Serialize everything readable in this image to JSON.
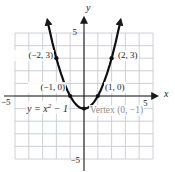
{
  "figure": {
    "bg": "#ffffff",
    "grid_color": "#c6cbd1",
    "axis_color": "#1a1a1a",
    "curve_color": "#101010",
    "point_color": "#101010",
    "text_color": "#1b1b1b",
    "vertex_label_color": "#8e8e8e"
  },
  "chart_data": {
    "type": "line",
    "title": "",
    "equation": "y = x^2 − 1",
    "equation_parts": {
      "y": "y",
      "equals": " = ",
      "x": "x",
      "sup": "2",
      "rest": " − 1"
    },
    "xlabel": "x",
    "ylabel": "y",
    "xlim": [
      -5,
      5
    ],
    "ylim": [
      -5,
      5
    ],
    "grid": true,
    "curve": {
      "a": 1,
      "b": 0,
      "c": -1,
      "x_range": [
        -2.64,
        2.64
      ]
    },
    "points": [
      {
        "x": -2,
        "y": 3,
        "label": "(−2, 3)"
      },
      {
        "x": 2,
        "y": 3,
        "label": "(2, 3)"
      },
      {
        "x": -1,
        "y": 0,
        "label": "(−1, 0)"
      },
      {
        "x": 1,
        "y": 0,
        "label": "(1, 0)"
      },
      {
        "x": 0,
        "y": -1,
        "label": "Vertex (0, −1)"
      }
    ],
    "tick_labels": {
      "y_top": "5",
      "y_bottom": "−5",
      "x_left": "−5",
      "x_right": "5"
    }
  }
}
